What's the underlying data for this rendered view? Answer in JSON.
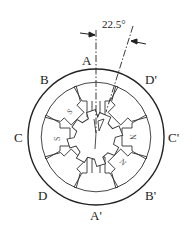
{
  "diagram": {
    "title": "",
    "type": "stepper-motor-cross-section",
    "angle_annotation": "22.5°",
    "phase_labels": {
      "A": "A",
      "B": "B",
      "C": "C",
      "D": "D",
      "A_prime": "A'",
      "B_prime": "B'",
      "C_prime": "C'",
      "D_prime": "D'"
    },
    "pole_markings": {
      "s_upper_left": "S",
      "s_left": "S",
      "n_right": "N",
      "n_lower_right": "N"
    },
    "stator_poles": 8,
    "rotor_teeth": 6,
    "colors": {
      "line": "#222222",
      "background": "#ffffff"
    }
  }
}
